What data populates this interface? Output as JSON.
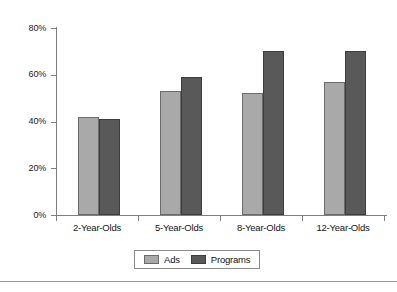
{
  "chart_data": {
    "type": "bar",
    "title": "",
    "subtitle": "",
    "xlabel": "",
    "ylabel": "",
    "categories": [
      "2-Year-Olds",
      "5-Year-Olds",
      "8-Year-Olds",
      "12-Year-Olds"
    ],
    "series": [
      {
        "name": "Ads",
        "values": [
          42,
          53,
          52,
          57
        ],
        "color": "#a9a9a9"
      },
      {
        "name": "Programs",
        "values": [
          41,
          59,
          70,
          70
        ],
        "color": "#595959"
      }
    ],
    "ylim": [
      0,
      80
    ],
    "y_ticks": [
      0,
      20,
      40,
      60,
      80
    ],
    "y_tick_labels": [
      "0%",
      "20%",
      "40%",
      "60%",
      "80%"
    ],
    "value_suffix": "%",
    "grid": false,
    "legend_position": "bottom",
    "legend_entries": [
      "Ads",
      "Programs"
    ]
  },
  "legend": {
    "entries": [
      {
        "label": "Ads",
        "swatch": "legend-swatch-ads"
      },
      {
        "label": "Programs",
        "swatch": "legend-swatch-programs"
      }
    ]
  },
  "axes": {
    "y_tick_labels": [
      "80%",
      "60%",
      "40%",
      "20%",
      "0%"
    ],
    "x_tick_labels": [
      "2-Year-Olds",
      "5-Year-Olds",
      "8-Year-Olds",
      "12-Year-Olds"
    ]
  },
  "colors": {
    "series_ads": "#a9a9a9",
    "series_programs": "#595959",
    "axis": "#808080",
    "text": "#141414",
    "background": "#ffffff",
    "rule": "#9a9a9a"
  }
}
